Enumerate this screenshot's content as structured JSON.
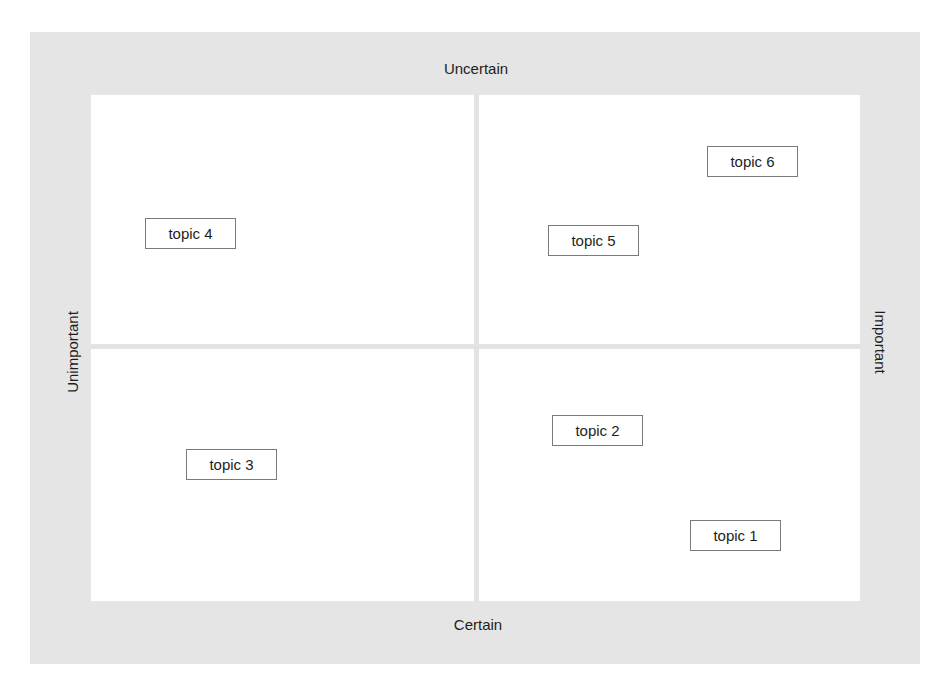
{
  "diagram": {
    "type": "2x2 matrix",
    "axes": {
      "top": "Uncertain",
      "bottom": "Certain",
      "left": "Unimportant",
      "right": "Important"
    },
    "topics": [
      {
        "label": "topic 1",
        "quadrant": "certain-important",
        "x": 690,
        "y": 520
      },
      {
        "label": "topic 2",
        "quadrant": "certain-important",
        "x": 552,
        "y": 415
      },
      {
        "label": "topic 3",
        "quadrant": "certain-unimportant",
        "x": 186,
        "y": 449
      },
      {
        "label": "topic 4",
        "quadrant": "uncertain-unimportant",
        "x": 145,
        "y": 218
      },
      {
        "label": "topic 5",
        "quadrant": "uncertain-important",
        "x": 548,
        "y": 225
      },
      {
        "label": "topic 6",
        "quadrant": "uncertain-important",
        "x": 707,
        "y": 146
      }
    ],
    "colors": {
      "frame": "#e5e5e5",
      "plot": "#ffffff",
      "divider": "#e3e3e3",
      "box_border": "#7a7a7a",
      "text": "#1e1e1e"
    }
  }
}
